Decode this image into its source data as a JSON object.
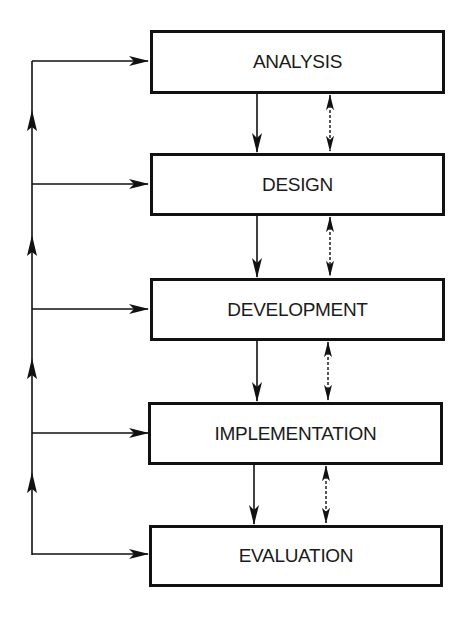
{
  "diagram": {
    "type": "flowchart",
    "stages": [
      {
        "id": "analysis",
        "label": "ANALYSIS"
      },
      {
        "id": "design",
        "label": "DESIGN"
      },
      {
        "id": "development",
        "label": "DEVELOPMENT"
      },
      {
        "id": "implementation",
        "label": "IMPLEMENTATION"
      },
      {
        "id": "evaluation",
        "label": "EVALUATION"
      }
    ],
    "connections": [
      {
        "from": "analysis",
        "to": "design",
        "style": "solid",
        "direction": "down"
      },
      {
        "from": "analysis",
        "to": "design",
        "style": "dashed",
        "direction": "bidirectional"
      },
      {
        "from": "design",
        "to": "development",
        "style": "solid",
        "direction": "down"
      },
      {
        "from": "design",
        "to": "development",
        "style": "dashed",
        "direction": "bidirectional"
      },
      {
        "from": "development",
        "to": "implementation",
        "style": "solid",
        "direction": "down"
      },
      {
        "from": "development",
        "to": "implementation",
        "style": "dashed",
        "direction": "bidirectional"
      },
      {
        "from": "implementation",
        "to": "evaluation",
        "style": "solid",
        "direction": "down"
      },
      {
        "from": "implementation",
        "to": "evaluation",
        "style": "dashed",
        "direction": "bidirectional"
      }
    ],
    "feedback_loop": {
      "description": "Left-side vertical line flowing upward from evaluation, with arrows feeding into every stage",
      "targets": [
        "analysis",
        "design",
        "development",
        "implementation",
        "evaluation"
      ]
    },
    "colors": {
      "line": "#111111",
      "background": "#ffffff",
      "text": "#1a1a1a"
    }
  }
}
